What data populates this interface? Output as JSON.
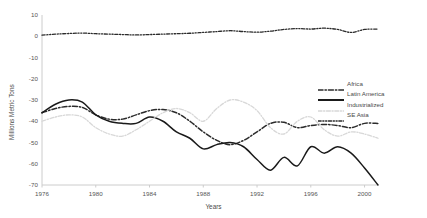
{
  "chart_data": {
    "type": "line",
    "title": "",
    "xlabel": "Years",
    "ylabel": "Millions Metric Tons",
    "xlim": [
      1976,
      2001
    ],
    "ylim": [
      -70,
      10
    ],
    "ytick_step": 10,
    "grid": false,
    "legend_position": "right-middle",
    "x_ticks": [
      "1976",
      "1980",
      "1984",
      "1988",
      "1992",
      "1996",
      "2000"
    ],
    "x_tick_values": [
      1976,
      1980,
      1984,
      1988,
      1992,
      1996,
      2000
    ],
    "y_ticks": [
      "10",
      "0",
      "-10",
      "-20",
      "-30",
      "-40",
      "-50",
      "-60",
      "-70"
    ],
    "y_tick_values": [
      10,
      0,
      -10,
      -20,
      -30,
      -40,
      -50,
      -60,
      -70
    ],
    "x": [
      1976,
      1977,
      1978,
      1979,
      1980,
      1981,
      1982,
      1983,
      1984,
      1985,
      1986,
      1987,
      1988,
      1989,
      1990,
      1991,
      1992,
      1993,
      1994,
      1995,
      1996,
      1997,
      1998,
      1999,
      2000,
      2001
    ],
    "series": [
      {
        "name": "Africa",
        "style": "dash-dot",
        "color": "#2b2b2b",
        "width": 1.5,
        "values": [
          -36,
          -34,
          -33,
          -33.5,
          -37,
          -39,
          -39,
          -37,
          -35,
          -34.5,
          -36,
          -40,
          -45,
          -49,
          -51,
          -49,
          -45,
          -41,
          -40.5,
          -43,
          -42,
          -41.5,
          -42,
          -43,
          -41,
          -41
        ]
      },
      {
        "name": "Latin America",
        "style": "solid",
        "color": "#1a1a1a",
        "width": 1.5,
        "values": [
          -36,
          -32,
          -30,
          -31,
          -37,
          -40,
          -41,
          -41,
          -38,
          -40,
          -45,
          -48,
          -53,
          -51,
          -50,
          -52,
          -58,
          -63,
          -57,
          -61,
          -52,
          -55,
          -52,
          -55,
          -62,
          -70
        ]
      },
      {
        "name": "Industrialized",
        "style": "light-dash",
        "color": "#d8d8d8",
        "width": 1.3,
        "values": [
          -40,
          -38,
          -37,
          -38,
          -43,
          -46,
          -47,
          -44,
          -40,
          -36,
          -34,
          -36,
          -40,
          -34,
          -30,
          -31,
          -35,
          -43,
          -46,
          -40,
          -38,
          -44,
          -47,
          -45,
          -46,
          -48
        ]
      },
      {
        "name": "SE Asia",
        "style": "dash-dot-dot",
        "color": "#2b2b2b",
        "width": 1.3,
        "values": [
          0.5,
          1,
          1.3,
          1.5,
          1.2,
          1,
          0.8,
          0.6,
          0.8,
          1,
          1.2,
          1.4,
          1.8,
          2.2,
          2.6,
          2.2,
          1.9,
          2.4,
          3.2,
          3.6,
          3.4,
          3.8,
          3.2,
          1.8,
          3.2,
          3.4
        ]
      }
    ]
  },
  "legend": {
    "items": [
      {
        "label": "Africa"
      },
      {
        "label": "Latin America"
      },
      {
        "label": "Industrialized"
      },
      {
        "label": "SE Asia"
      }
    ]
  }
}
